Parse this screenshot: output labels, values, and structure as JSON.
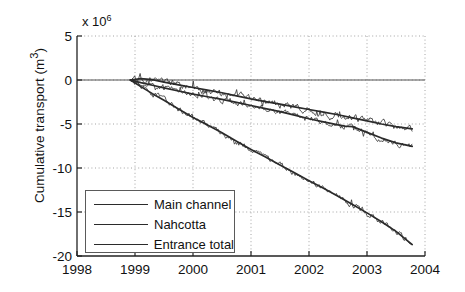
{
  "chart_data": {
    "type": "line",
    "title": "",
    "xlabel": "",
    "ylabel": "Cumulative transport (m3)",
    "ylabel_display": "Cumulative transport (m",
    "ylabel_sup": "3",
    "ylabel_tail": ")",
    "y_multiplier": "x 10",
    "y_multiplier_exp": "6",
    "xlim": [
      1998,
      2004
    ],
    "ylim": [
      -20,
      5
    ],
    "xticks": [
      1998,
      1999,
      2000,
      2001,
      2002,
      2003,
      2004
    ],
    "xtick_labels": [
      "1998",
      "1999",
      "2000",
      "2001",
      "2002",
      "2003",
      "2004"
    ],
    "yticks": [
      5,
      0,
      -5,
      -10,
      -15,
      -20
    ],
    "ytick_labels": [
      "5",
      "0",
      "-5",
      "-10",
      "-15",
      "-20"
    ],
    "grid": true,
    "grid_style": "dotted",
    "legend_position": "lower left",
    "zero_line": true,
    "series": [
      {
        "name": "Main channel",
        "color": "#2b2b2b",
        "x": [
          1998.92,
          1999.1,
          1999.3,
          1999.5,
          1999.75,
          2000.0,
          2000.25,
          2000.5,
          2000.75,
          2001.0,
          2001.25,
          2001.5,
          2001.75,
          2002.0,
          2002.25,
          2002.5,
          2002.75,
          2003.0,
          2003.25,
          2003.5,
          2003.78
        ],
        "y": [
          0.0,
          0.15,
          0.05,
          -0.25,
          -0.55,
          -0.85,
          -1.15,
          -1.45,
          -1.8,
          -2.15,
          -2.45,
          -2.75,
          -3.05,
          -3.35,
          -3.65,
          -3.95,
          -4.3,
          -4.65,
          -5.0,
          -5.3,
          -5.55
        ]
      },
      {
        "name": "Nahcotta",
        "color": "#2b2b2b",
        "x": [
          1998.92,
          1999.1,
          1999.3,
          1999.5,
          1999.75,
          2000.0,
          2000.25,
          2000.5,
          2000.75,
          2001.0,
          2001.25,
          2001.5,
          2001.75,
          2002.0,
          2002.25,
          2002.5,
          2002.62,
          2002.75,
          2003.0,
          2003.25,
          2003.5,
          2003.78
        ],
        "y": [
          0.0,
          -0.3,
          -0.6,
          -0.9,
          -1.25,
          -1.6,
          -1.9,
          -2.2,
          -2.55,
          -2.9,
          -3.25,
          -3.6,
          -4.0,
          -4.4,
          -4.75,
          -5.1,
          -5.25,
          -5.3,
          -5.95,
          -6.6,
          -7.15,
          -7.55
        ]
      },
      {
        "name": "Entrance total",
        "color": "#2b2b2b",
        "x": [
          1998.92,
          1999.1,
          1999.3,
          1999.5,
          1999.75,
          2000.0,
          2000.25,
          2000.5,
          2000.75,
          2001.0,
          2001.25,
          2001.5,
          2001.75,
          2002.0,
          2002.25,
          2002.5,
          2002.75,
          2003.0,
          2003.25,
          2003.5,
          2003.78
        ],
        "y": [
          0.0,
          -0.75,
          -1.55,
          -2.3,
          -3.3,
          -4.25,
          -5.1,
          -6.0,
          -6.95,
          -7.9,
          -8.75,
          -9.65,
          -10.55,
          -11.45,
          -12.3,
          -13.2,
          -14.15,
          -15.1,
          -16.1,
          -17.2,
          -18.7
        ]
      }
    ],
    "noise_series": [
      {
        "name": "Main channel raw",
        "ref": 0,
        "amplitude": 0.38
      },
      {
        "name": "Nahcotta raw",
        "ref": 1,
        "amplitude": 0.33
      },
      {
        "name": "Entrance total raw",
        "ref": 2,
        "amplitude": 0.3
      }
    ]
  },
  "legend": {
    "items": [
      {
        "label": "Main channel"
      },
      {
        "label": "Nahcotta"
      },
      {
        "label": "Entrance total"
      }
    ]
  }
}
